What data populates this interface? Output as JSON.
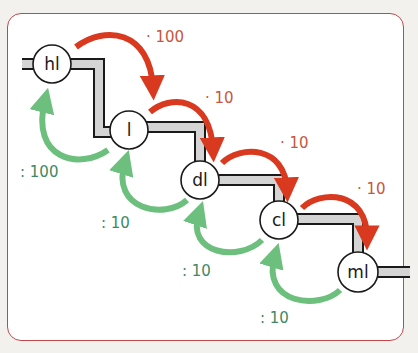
{
  "diagram": {
    "colors": {
      "frame_border": "#c0474a",
      "down_arrow": "#d8391f",
      "up_arrow": "#6cbf7d",
      "down_label": "#c8563e",
      "up_label": "#3d8a62",
      "stair_fill": "#d4d4d4",
      "stair_outline": "#1a1a1a"
    },
    "nodes": [
      {
        "id": "hl",
        "label": "hl"
      },
      {
        "id": "l",
        "label": "l"
      },
      {
        "id": "dl",
        "label": "dl"
      },
      {
        "id": "cl",
        "label": "cl"
      },
      {
        "id": "ml",
        "label": "ml"
      }
    ],
    "down_steps": [
      {
        "from": "hl",
        "to": "l",
        "label": "· 100"
      },
      {
        "from": "l",
        "to": "dl",
        "label": "· 10"
      },
      {
        "from": "dl",
        "to": "cl",
        "label": "· 10"
      },
      {
        "from": "cl",
        "to": "ml",
        "label": "· 10"
      }
    ],
    "up_steps": [
      {
        "from": "l",
        "to": "hl",
        "label": ": 100"
      },
      {
        "from": "dl",
        "to": "l",
        "label": ": 10"
      },
      {
        "from": "cl",
        "to": "dl",
        "label": ": 10"
      },
      {
        "from": "ml",
        "to": "cl",
        "label": ": 10"
      }
    ]
  }
}
